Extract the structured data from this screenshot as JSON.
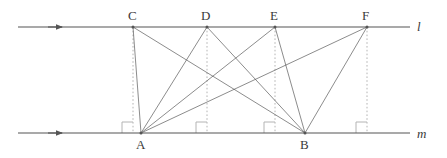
{
  "figure": {
    "type": "geometry-diagram",
    "width": 447,
    "height": 158,
    "background_color": "#ffffff",
    "stroke_color": "#555555",
    "dotted_color": "#b4b4b4",
    "label_color": "#3a3a3a"
  },
  "lines": [
    {
      "id": "line-l",
      "label": "l",
      "y": 27,
      "x_start": 18,
      "x_end": 410,
      "label_x": 417,
      "label_y": 20,
      "arrow_x": 62,
      "arrow_dir": "right"
    },
    {
      "id": "line-m",
      "label": "m",
      "y": 133,
      "x_start": 18,
      "x_end": 410,
      "label_x": 417,
      "label_y": 127,
      "arrow_x": 62,
      "arrow_dir": "right"
    }
  ],
  "points": [
    {
      "id": "C",
      "label": "C",
      "x": 133,
      "y": 27,
      "on": "l",
      "label_x": 128,
      "label_y": 9
    },
    {
      "id": "D",
      "label": "D",
      "x": 207,
      "y": 27,
      "on": "l",
      "label_x": 201,
      "label_y": 9
    },
    {
      "id": "E",
      "label": "E",
      "x": 275,
      "y": 27,
      "on": "l",
      "label_x": 270,
      "label_y": 9
    },
    {
      "id": "F",
      "label": "F",
      "x": 367,
      "y": 27,
      "on": "l",
      "label_x": 362,
      "label_y": 9
    },
    {
      "id": "A",
      "label": "A",
      "x": 141,
      "y": 133,
      "on": "m",
      "label_x": 136,
      "label_y": 138
    },
    {
      "id": "B",
      "label": "B",
      "x": 305,
      "y": 133,
      "on": "m",
      "label_x": 300,
      "label_y": 138
    }
  ],
  "segments": [
    {
      "from": "C",
      "to": "A"
    },
    {
      "from": "C",
      "to": "B"
    },
    {
      "from": "D",
      "to": "A"
    },
    {
      "from": "D",
      "to": "B"
    },
    {
      "from": "E",
      "to": "A"
    },
    {
      "from": "E",
      "to": "B"
    },
    {
      "from": "F",
      "to": "A"
    },
    {
      "from": "F",
      "to": "B"
    }
  ],
  "altitudes": [
    {
      "id": "alt-C",
      "x": 133,
      "y_top": 27,
      "y_bottom": 133,
      "style": "dotted"
    },
    {
      "id": "alt-D",
      "x": 207,
      "y_top": 27,
      "y_bottom": 133,
      "style": "dotted"
    },
    {
      "id": "alt-E",
      "x": 275,
      "y_top": 27,
      "y_bottom": 133,
      "style": "dotted"
    },
    {
      "id": "alt-F",
      "x": 367,
      "y_top": 27,
      "y_bottom": 133,
      "style": "dotted"
    }
  ],
  "right_angle_marks": [
    {
      "id": "ra-C",
      "x": 133,
      "y": 133,
      "size": 11,
      "side": "left"
    },
    {
      "id": "ra-D",
      "x": 207,
      "y": 133,
      "size": 11,
      "side": "left"
    },
    {
      "id": "ra-E",
      "x": 275,
      "y": 133,
      "size": 11,
      "side": "left"
    },
    {
      "id": "ra-F",
      "x": 367,
      "y": 133,
      "size": 11,
      "side": "left"
    }
  ]
}
